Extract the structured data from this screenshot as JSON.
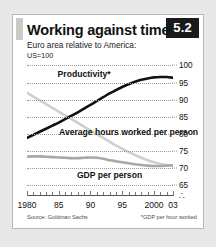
{
  "panel": {
    "badge": "5.2",
    "title": "Working against time",
    "subtitle": "Euro area relative to America:",
    "subtitle2": "US=100",
    "source": "Source: Goldman Sachs",
    "footnote": "*GDP per hour worked"
  },
  "chart_data": {
    "type": "line",
    "title": "Working against time",
    "subtitle": "Euro area relative to America: US=100",
    "xlabel": "",
    "ylabel": "US=100",
    "xlim": [
      1980,
      2003
    ],
    "ylim": [
      63,
      101
    ],
    "grid": true,
    "legend": "inline-labels",
    "yticks": [
      100,
      95,
      90,
      85,
      80,
      75,
      70,
      65
    ],
    "ytick_labels": [
      "100",
      "95",
      "90",
      "85",
      "80",
      "75",
      "70",
      "65"
    ],
    "axis_break_symbol": "∴",
    "xticks": [
      1980,
      1985,
      1990,
      1995,
      2000,
      2003
    ],
    "xtick_labels": [
      "1980",
      "85",
      "90",
      "95",
      "2000",
      "03"
    ],
    "x": [
      1980,
      1981,
      1982,
      1983,
      1984,
      1985,
      1986,
      1987,
      1988,
      1989,
      1990,
      1991,
      1992,
      1993,
      1994,
      1995,
      1996,
      1997,
      1998,
      1999,
      2000,
      2001,
      2002,
      2003
    ],
    "series": [
      {
        "name": "Productivity*",
        "label": "Productivity*",
        "color": "#111111",
        "width": 2.6,
        "values": [
          78.8,
          79.7,
          80.6,
          81.5,
          82.4,
          83.3,
          84.3,
          85.3,
          86.3,
          87.4,
          88.5,
          89.6,
          90.7,
          91.8,
          92.8,
          93.7,
          94.5,
          95.2,
          95.8,
          96.2,
          96.5,
          96.6,
          96.6,
          96.4
        ]
      },
      {
        "name": "Average hours worked per person",
        "label": "Average hours\nworked per person",
        "color": "#cfcfcd",
        "width": 2.6,
        "values": [
          92.0,
          90.9,
          89.8,
          88.7,
          87.6,
          86.5,
          85.4,
          84.3,
          83.2,
          82.1,
          81.0,
          79.9,
          78.8,
          77.7,
          76.6,
          75.6,
          74.7,
          73.8,
          73.0,
          72.3,
          71.7,
          71.2,
          70.9,
          70.7
        ]
      },
      {
        "name": "GDP per person",
        "label": "GDP per person",
        "color": "#a8a8a6",
        "width": 2.6,
        "values": [
          73.3,
          73.4,
          73.4,
          73.3,
          73.2,
          73.1,
          73.0,
          72.9,
          72.9,
          73.0,
          73.1,
          73.0,
          72.7,
          72.3,
          72.0,
          71.7,
          71.4,
          71.1,
          70.9,
          70.7,
          70.6,
          70.6,
          70.7,
          70.8
        ]
      }
    ],
    "annotations": [
      {
        "text": "Productivity*",
        "x": 1989,
        "y": 97.5
      },
      {
        "text": "Average hours worked per person",
        "x": 1996,
        "y": 80.5
      },
      {
        "text": "GDP per person",
        "x": 1993,
        "y": 68.0
      }
    ]
  }
}
